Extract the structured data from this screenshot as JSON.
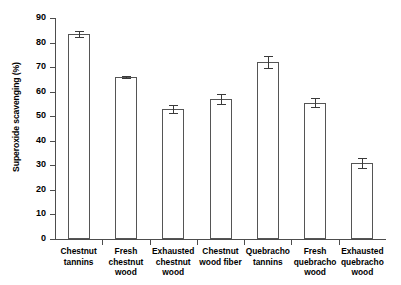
{
  "chart_data": {
    "type": "bar",
    "title": "",
    "xlabel": "",
    "ylabel": "Superoxide scavenging (%)",
    "ylim": [
      0,
      90
    ],
    "ytick_step": 10,
    "grid": false,
    "legend": "none",
    "categories": [
      "Chestnut\ntannins",
      "Fresh\nchestnut\nwood",
      "Exhausted\nchestnut\nwood",
      "Chestnut\nwood fiber",
      "Quebracho\ntannins",
      "Fresh\nquebracho\nwood",
      "Exhausted\nquebracho\nwood"
    ],
    "values": [
      83.5,
      66.0,
      53.0,
      57.0,
      72.0,
      55.5,
      31.0
    ],
    "errors": [
      1.3,
      0.4,
      1.7,
      1.9,
      2.4,
      1.9,
      2.0
    ],
    "yticks": [
      "0",
      "10",
      "20",
      "30",
      "40",
      "50",
      "60",
      "70",
      "80",
      "90"
    ],
    "bar_facecolor": "#ffffff",
    "bar_edgecolor": "#555555",
    "axis_color": "#4d4d4d"
  },
  "ytick_labels": [
    {
      "label": "90"
    },
    {
      "label": "80"
    },
    {
      "label": "70"
    },
    {
      "label": "60"
    },
    {
      "label": "50"
    },
    {
      "label": "40"
    },
    {
      "label": "30"
    },
    {
      "label": "20"
    },
    {
      "label": "10"
    },
    {
      "label": "0"
    }
  ],
  "categories": [
    {
      "label": "Chestnut\ntannins"
    },
    {
      "label": "Fresh\nchestnut\nwood"
    },
    {
      "label": "Exhausted\nchestnut\nwood"
    },
    {
      "label": "Chestnut\nwood fiber"
    },
    {
      "label": "Quebracho\ntannins"
    },
    {
      "label": "Fresh\nquebracho\nwood"
    },
    {
      "label": "Exhausted\nquebracho\nwood"
    }
  ],
  "axis": {
    "y_title": "Superoxide scavenging (%)"
  }
}
